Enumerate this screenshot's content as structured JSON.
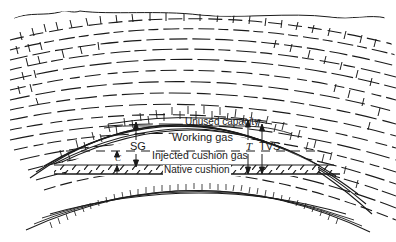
{
  "diagram": {
    "labels": {
      "unused_capacity": "Unused capacity",
      "working_gas": "Working gas",
      "injected_cushion_gas": "Injected cushion gas",
      "native_cushion": "Native cushion",
      "sg": "SG",
      "c": "C",
      "t": "T",
      "tvs": "TVS"
    },
    "layers": [
      {
        "name": "surface-rock",
        "pattern": "brick-and-dash"
      },
      {
        "name": "shale-band-upper",
        "pattern": "dash"
      },
      {
        "name": "cap-rock-arch",
        "pattern": "brick"
      },
      {
        "name": "reservoir",
        "pattern": "open"
      },
      {
        "name": "native-cushion-band",
        "pattern": "hatch"
      },
      {
        "name": "base-rock-arch",
        "pattern": "brick"
      }
    ],
    "colors": {
      "ink": "#1a1a1a",
      "background": "#ffffff"
    }
  }
}
